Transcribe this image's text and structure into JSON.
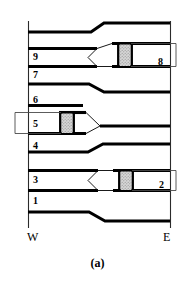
{
  "figure": {
    "caption": "(a)",
    "direction_left": "W",
    "direction_right": "E",
    "colors": {
      "line": "#000000",
      "thin_line": "#1a1a1a",
      "hatch_fill": "#c9c9c9",
      "background": "#ffffff"
    },
    "unit_labels": [
      {
        "id": "unit-9",
        "text": "9"
      },
      {
        "id": "unit-7",
        "text": "7"
      },
      {
        "id": "unit-6",
        "text": "6"
      },
      {
        "id": "unit-5",
        "text": "5"
      },
      {
        "id": "unit-4",
        "text": "4"
      },
      {
        "id": "unit-3",
        "text": "3"
      },
      {
        "id": "unit-1",
        "text": "1"
      },
      {
        "id": "unit-8",
        "text": "8"
      },
      {
        "id": "unit-2",
        "text": "2"
      }
    ]
  }
}
